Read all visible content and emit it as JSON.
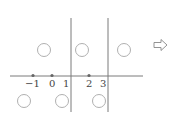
{
  "diagram": {
    "type": "number-line-regions",
    "axis": {
      "tick_labels": [
        "−1",
        "0",
        "1",
        "2",
        "3"
      ],
      "marked_points": [
        "-1",
        "0",
        "2"
      ]
    },
    "vertical_dividers_at": [
      "1",
      "3"
    ],
    "blank_circles": {
      "upper_row_count": 3,
      "lower_row_count": 3
    },
    "arrow": "hollow-right-arrow"
  },
  "colors": {
    "line": "#7a7a7a",
    "circle": "#b0b0b0",
    "point": "#666666",
    "text": "#444444"
  }
}
